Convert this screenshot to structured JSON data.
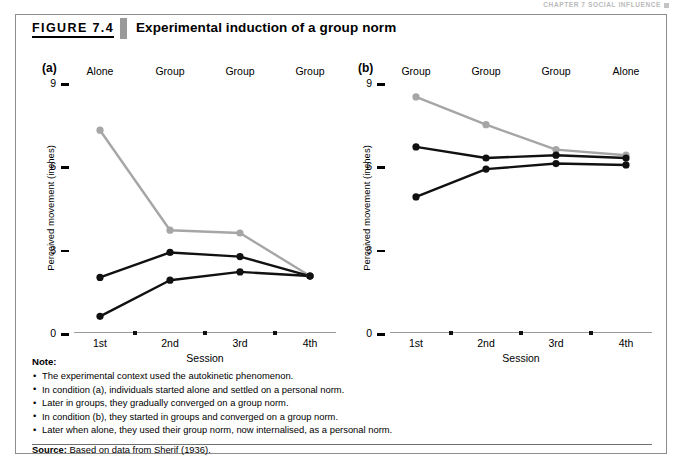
{
  "running_header": "CHAPTER 7  SOCIAL INFLUENCE",
  "figure": {
    "number": "FIGURE 7.4",
    "title": "Experimental induction of a group norm"
  },
  "notes": {
    "heading": "Note:",
    "items": [
      "The experimental context used the autokinetic phenomenon.",
      "In condition (a), individuals started alone and settled on a personal norm.",
      "Later in groups, they gradually converged on a group norm.",
      "In condition (b), they started in groups and converged on a group norm.",
      "Later when alone, they used their group norm, now internalised, as a personal norm."
    ],
    "source_label": "Source:",
    "source_text": "Based on data from Sherif (1936)."
  },
  "colors": {
    "gray_series": "#a6a6a6",
    "black_series": "#111111",
    "axis": "#9b9b9b",
    "accent_bar": "#9a9a9a"
  },
  "chart_data": [
    {
      "type": "line",
      "panel": "(a)",
      "title": "",
      "xlabel": "Session",
      "ylabel": "Perceived movement (inches)",
      "categories": [
        "1st",
        "2nd",
        "3rd",
        "4th"
      ],
      "column_headers": [
        "Alone",
        "Group",
        "Group",
        "Group"
      ],
      "yticks": [
        0,
        3,
        6,
        9
      ],
      "ylim": [
        0,
        9
      ],
      "grid": false,
      "legend": "none",
      "series": [
        {
          "name": "participant-1",
          "color": "#a6a6a6",
          "values": [
            7.3,
            3.7,
            3.6,
            2.05
          ]
        },
        {
          "name": "participant-2",
          "color": "#111111",
          "values": [
            2.0,
            2.9,
            2.75,
            2.05
          ]
        },
        {
          "name": "participant-3",
          "color": "#111111",
          "values": [
            0.6,
            1.9,
            2.2,
            2.05
          ]
        }
      ]
    },
    {
      "type": "line",
      "panel": "(b)",
      "title": "",
      "xlabel": "Session",
      "ylabel": "Perceived movement (inches)",
      "categories": [
        "1st",
        "2nd",
        "3rd",
        "4th"
      ],
      "column_headers": [
        "Group",
        "Group",
        "Group",
        "Alone"
      ],
      "yticks": [
        0,
        3,
        6,
        9
      ],
      "ylim": [
        0,
        9
      ],
      "grid": false,
      "legend": "none",
      "series": [
        {
          "name": "participant-1",
          "color": "#a6a6a6",
          "values": [
            8.5,
            7.5,
            6.6,
            6.4
          ]
        },
        {
          "name": "participant-2",
          "color": "#111111",
          "values": [
            6.7,
            6.3,
            6.4,
            6.3
          ]
        },
        {
          "name": "participant-3",
          "color": "#111111",
          "values": [
            4.9,
            5.9,
            6.1,
            6.05
          ]
        }
      ]
    }
  ]
}
